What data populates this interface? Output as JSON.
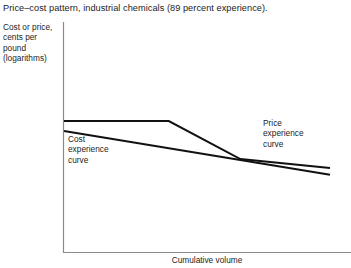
{
  "chart_data": {
    "type": "line",
    "title": "Price–cost pattern, industrial chemicals (89 percent experience).",
    "xlabel": "Cumulative volume",
    "ylabel": "Cost or price, cents per pound (logarithms)",
    "ylabel_lines": [
      "Cost or price,",
      "cents per",
      "pound",
      "(logarithms)"
    ],
    "axis_scale": "logarithmic",
    "grid": false,
    "xlim": [
      0,
      100
    ],
    "ylim": [
      0,
      100
    ],
    "axis_ticks": [],
    "legend_position": "inline-annotations",
    "line_color": "#111111",
    "axis_color": "#8a8a8a",
    "background_color": "#ffffff",
    "annotations": [
      {
        "name": "cost-experience-curve",
        "lines": [
          "Cost",
          "experience",
          "curve"
        ],
        "text": "Cost experience curve"
      },
      {
        "name": "price-experience-curve",
        "lines": [
          "Price",
          "experience",
          "curve"
        ],
        "text": "Price experience curve"
      }
    ],
    "series": [
      {
        "name": "Price experience curve",
        "points": [
          {
            "x": 0.0,
            "y": 100.0
          },
          {
            "x": 39.4,
            "y": 100.0
          },
          {
            "x": 66.3,
            "y": 74.2
          },
          {
            "x": 100.0,
            "y": 68.2
          }
        ]
      },
      {
        "name": "Cost experience curve",
        "points": [
          {
            "x": 0.0,
            "y": 93.2
          },
          {
            "x": 100.0,
            "y": 63.6
          }
        ]
      }
    ]
  }
}
